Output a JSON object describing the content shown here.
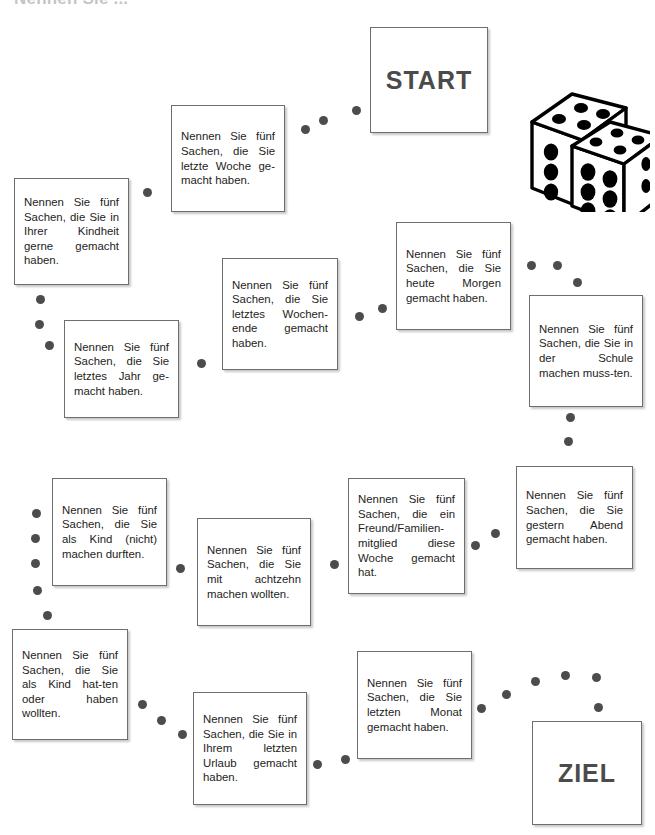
{
  "page": {
    "title": "Nennen Sie ...",
    "background_color": "#ffffff",
    "text_color": "#1d1d1b",
    "accent_color": "#4b4b4b",
    "dot_color": "#4c4c4c",
    "border_color": "#6e6e6e"
  },
  "terminals": {
    "start": {
      "label": "START"
    },
    "ziel": {
      "label": "ZIEL"
    }
  },
  "decor": {
    "dice_icon": "two-dice-icon",
    "dice_faces": [
      5,
      6
    ]
  },
  "cards": [
    {
      "id": "letzte-woche",
      "text": "Nennen Sie fünf Sachen, die Sie letzte Woche ge-macht haben."
    },
    {
      "id": "kindheit",
      "text": "Nennen Sie fünf Sachen, die Sie in Ihrer Kindheit gerne gemacht haben."
    },
    {
      "id": "letztes-jahr",
      "text": "Nennen Sie fünf Sachen, die Sie letztes Jahr ge-macht haben."
    },
    {
      "id": "wochenende",
      "text": "Nennen Sie fünf Sachen, die Sie letztes Wochen-ende gemacht haben."
    },
    {
      "id": "heute-morgen",
      "text": "Nennen Sie fünf Sachen, die Sie heute Morgen gemacht haben."
    },
    {
      "id": "schule",
      "text": "Nennen Sie fünf Sachen, die Sie in der Schule machen muss-ten."
    },
    {
      "id": "gestern-abend",
      "text": "Nennen Sie fünf Sachen, die Sie gestern Abend gemacht haben."
    },
    {
      "id": "freund-familie",
      "text": "Nennen Sie fünf Sachen, die ein Freund/Familien-mitglied diese Woche gemacht hat."
    },
    {
      "id": "als-kind-nicht",
      "text": "Nennen Sie fünf Sachen, die Sie als Kind (nicht) machen durften."
    },
    {
      "id": "mit-achtzehn",
      "text": "Nennen Sie fünf Sachen, die Sie mit achtzehn machen wollten."
    },
    {
      "id": "als-kind-hatten",
      "text": "Nennen Sie fünf Sachen, die Sie als Kind hat-ten oder haben wollten."
    },
    {
      "id": "urlaub",
      "text": "Nennen Sie fünf Sachen, die Sie in Ihrem letzten Urlaub gemacht haben."
    },
    {
      "id": "letzten-monat",
      "text": "Nennen Sie fünf Sachen, die Sie letzten Monat gemacht haben."
    }
  ]
}
